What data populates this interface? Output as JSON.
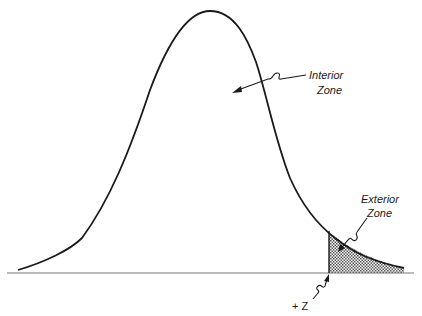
{
  "diagram": {
    "type": "normal-distribution-curve",
    "labels": {
      "interior_line1": "Interior",
      "interior_line2": "Zone",
      "exterior_line1": "Exterior",
      "exterior_line2": "Zone",
      "z_marker": "+ Z"
    },
    "colors": {
      "curve": "#1a1a1a",
      "baseline": "#777777",
      "hatch": "#444444"
    }
  }
}
